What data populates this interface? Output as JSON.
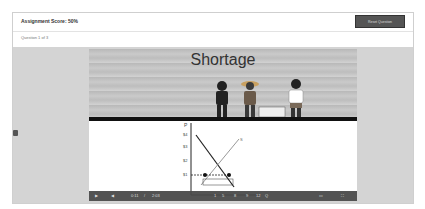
{
  "header": {
    "title": "Assignment Score: 50%",
    "reset_label": "Reset Question"
  },
  "question": {
    "counter": "Question 1 of 3"
  },
  "video": {
    "scene_title": "Shortage",
    "graph": {
      "price_labels": [
        "$4",
        "$3",
        "$2",
        "$1"
      ],
      "quantity_labels": [
        "1",
        "5",
        "8",
        "9",
        "12"
      ],
      "axis_p": "P",
      "axis_q": "Q",
      "supply_label": "S"
    },
    "controls": {
      "current_time": "0:11",
      "separator": "/",
      "duration": "2:03"
    }
  }
}
